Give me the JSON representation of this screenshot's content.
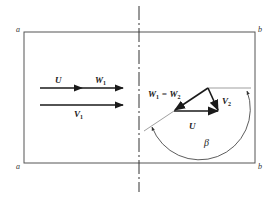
{
  "diagram": {
    "title": "",
    "frame": {
      "corner_labels": {
        "top_left": "a",
        "top_right": "b",
        "bottom_left": "a",
        "bottom_right": "b"
      }
    },
    "inlet": {
      "top_row": [
        {
          "name": "U",
          "label": "U"
        },
        {
          "name": "W1",
          "label": "W",
          "sub": "1"
        }
      ],
      "bottom_row": {
        "name": "V1",
        "label": "V",
        "sub": "1"
      }
    },
    "outlet": {
      "equation": {
        "left": "W",
        "left_sub": "1",
        "eq": " = ",
        "right": "W",
        "right_sub": "2"
      },
      "v2": {
        "label": "V",
        "sub": "2"
      },
      "u": {
        "label": "U"
      },
      "angle": {
        "label": "β"
      }
    },
    "colors": {
      "line": "#1a1a1a",
      "frame": "#555555",
      "thin": "#777777"
    }
  }
}
